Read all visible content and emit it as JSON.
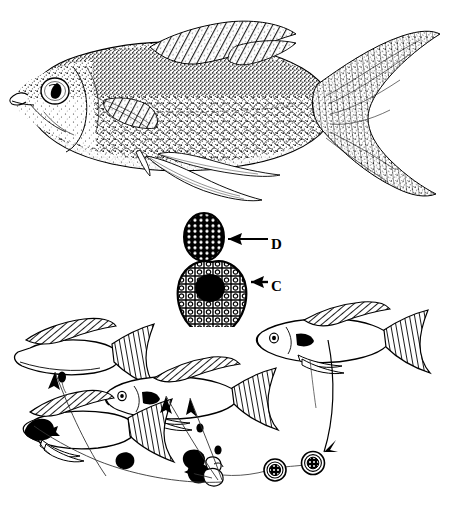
{
  "figure": {
    "background_color": "#ffffff",
    "ink_color": "#000000",
    "width": 466,
    "height": 515,
    "panels": [
      {
        "id": "specimen",
        "name": "stippled-fish-specimen-illustration",
        "caption": "",
        "description": "Detailed stipple-and-line drawing of a lateral view of a fish with dorsal fin, pectoral fin, pelvic fins, anal fin and deeply forked caudal fin"
      },
      {
        "id": "parasite",
        "name": "parasite-stage-illustration",
        "caption": "",
        "description": "Two stippled parasite bodies, a small oval spore above and a larger pear-shaped trophont below with a dark central nucleus"
      },
      {
        "id": "lifecycle",
        "name": "parasite-life-cycle-diagram",
        "caption": "",
        "description": "Four outline fish connected by curved arrows to a chain of dividing cysts and spores at lower centre"
      }
    ]
  },
  "labels": [
    {
      "id": "d",
      "text": "D",
      "target": "small-oval-spore",
      "arrow": "leader-line-to-left"
    },
    {
      "id": "c",
      "text": "C",
      "target": "pear-shaped-trophont",
      "arrow": "leader-line-to-left"
    }
  ],
  "lifecycle": {
    "fish": [
      {
        "id": "fish-upper-left",
        "label": "",
        "infected": true
      },
      {
        "id": "fish-middle",
        "label": "",
        "infected": true
      },
      {
        "id": "fish-lower-left",
        "label": "",
        "infected": true
      },
      {
        "id": "fish-right",
        "label": "",
        "infected": false
      }
    ],
    "stages": [
      {
        "id": "cyst-dark-1",
        "label": ""
      },
      {
        "id": "cyst-dark-2",
        "label": ""
      },
      {
        "id": "cyst-cluster",
        "label": ""
      },
      {
        "id": "spore-ringed-1",
        "label": ""
      },
      {
        "id": "spore-ringed-2",
        "label": ""
      }
    ],
    "arrows": [
      {
        "id": "arrow-to-fish-upper-left",
        "direction": "up-left"
      },
      {
        "id": "arrow-to-fish-middle-a",
        "direction": "up-left"
      },
      {
        "id": "arrow-to-fish-middle-b",
        "direction": "up-left"
      },
      {
        "id": "arrow-to-stage-chain",
        "direction": "left"
      },
      {
        "id": "arrow-from-fish-right",
        "direction": "down-left"
      }
    ]
  }
}
